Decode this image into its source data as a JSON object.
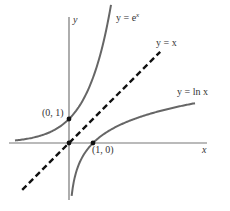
{
  "chart_data": {
    "type": "line",
    "title": "",
    "xlabel": "x",
    "ylabel": "y",
    "grid": false,
    "legend": "inline labels",
    "axis_pixel": {
      "origin": [
        69,
        143
      ],
      "unit": 24
    },
    "series": [
      {
        "name": "y = e^x",
        "label_base": "y = e",
        "label_sup": "x",
        "style": "solid",
        "color": "#666666",
        "x": [
          -2.25,
          -2,
          -1.5,
          -1,
          -0.5,
          0,
          0.5,
          1,
          1.5,
          1.75
        ],
        "y": [
          0.105,
          0.135,
          0.223,
          0.368,
          0.607,
          1,
          1.649,
          2.718,
          4.482,
          5.755
        ]
      },
      {
        "name": "y = x",
        "label": "y = x",
        "style": "dashed",
        "color": "#111111",
        "x": [
          -1.95,
          3.8
        ],
        "y": [
          -1.95,
          3.8
        ]
      },
      {
        "name": "y = ln x",
        "label": "y = ln x",
        "style": "solid",
        "color": "#666666",
        "x": [
          0.11,
          0.2,
          0.35,
          0.5,
          0.75,
          1,
          1.5,
          2,
          3,
          4,
          5.25
        ],
        "y": [
          -2.207,
          -1.609,
          -1.05,
          -0.693,
          -0.288,
          0,
          0.405,
          0.693,
          1.099,
          1.386,
          1.658
        ]
      }
    ],
    "points": [
      {
        "label": "(0, 1)",
        "x": 0,
        "y": 1
      },
      {
        "label": "(1, 0)",
        "x": 1,
        "y": 0
      },
      {
        "label": "",
        "x": 0,
        "y": 0
      }
    ]
  },
  "labels": {
    "x_axis": "x",
    "y_axis": "y",
    "ex_base": "y = e",
    "ex_sup": "x",
    "identity": "y = x",
    "ln": "y = ln x",
    "pt01": "(0, 1)",
    "pt10": "(1, 0)"
  },
  "colors": {
    "axis": "#777777",
    "curve": "#666666",
    "dashed": "#111111",
    "point": "#111111"
  }
}
